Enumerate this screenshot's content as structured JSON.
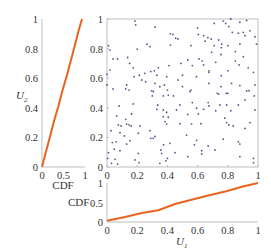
{
  "chart_data": [
    {
      "id": "scatter",
      "type": "scatter",
      "title": "",
      "xlabel": "",
      "ylabel": "",
      "xlim": [
        0,
        1
      ],
      "ylim": [
        0,
        1
      ],
      "xticks": [
        "0",
        "0.2",
        "0.4",
        "0.6",
        "0.8",
        "1"
      ],
      "yticks": [
        "0",
        "0.2",
        "0.4",
        "0.6",
        "0.8",
        "1"
      ],
      "grid": false,
      "marker_color": "#4a5a8c",
      "points": [
        [
          0.185,
          0.986
        ],
        [
          0.19,
          0.96
        ],
        [
          0.318,
          0.946
        ],
        [
          0.42,
          0.9
        ],
        [
          0.437,
          0.896
        ],
        [
          0.455,
          0.87
        ],
        [
          0.47,
          0.865
        ],
        [
          0.01,
          0.82
        ],
        [
          0.02,
          0.79
        ],
        [
          0.2,
          0.797
        ],
        [
          0.265,
          0.83
        ],
        [
          0.285,
          0.813
        ],
        [
          0.42,
          0.824
        ],
        [
          0.04,
          0.73
        ],
        [
          0.07,
          0.73
        ],
        [
          0.137,
          0.74
        ],
        [
          0.15,
          0.7
        ],
        [
          0.41,
          0.685
        ],
        [
          0.49,
          0.7
        ],
        [
          0.174,
          0.67
        ],
        [
          0.02,
          0.655
        ],
        [
          0.0,
          0.626
        ],
        [
          0.34,
          0.67
        ],
        [
          0.313,
          0.65
        ],
        [
          0.29,
          0.645
        ],
        [
          0.25,
          0.633
        ],
        [
          0.214,
          0.62
        ],
        [
          0.18,
          0.61
        ],
        [
          0.33,
          0.62
        ],
        [
          0.395,
          0.61
        ],
        [
          0.5,
          0.62
        ],
        [
          0.23,
          0.588
        ],
        [
          0.256,
          0.576
        ],
        [
          0.13,
          0.554
        ],
        [
          0.0,
          0.554
        ],
        [
          0.318,
          0.565
        ],
        [
          0.35,
          0.543
        ],
        [
          0.38,
          0.554
        ],
        [
          0.47,
          0.588
        ],
        [
          0.04,
          0.527
        ],
        [
          0.124,
          0.527
        ],
        [
          0.146,
          0.52
        ],
        [
          0.296,
          0.514
        ],
        [
          0.4,
          0.52
        ],
        [
          0.5,
          0.543
        ],
        [
          0.71,
          0.97
        ],
        [
          0.77,
          0.986
        ],
        [
          0.786,
          0.97
        ],
        [
          0.82,
          1.0
        ],
        [
          0.88,
          0.978
        ],
        [
          0.925,
          0.99
        ],
        [
          0.6,
          0.94
        ],
        [
          0.807,
          0.948
        ],
        [
          0.605,
          0.896
        ],
        [
          0.64,
          0.887
        ],
        [
          0.668,
          0.874
        ],
        [
          0.69,
          0.865
        ],
        [
          0.65,
          0.85
        ],
        [
          0.83,
          0.91
        ],
        [
          0.87,
          0.904
        ],
        [
          0.903,
          0.91
        ],
        [
          0.947,
          0.92
        ],
        [
          0.914,
          0.887
        ],
        [
          0.98,
          0.88
        ],
        [
          0.74,
          0.858
        ],
        [
          0.556,
          0.82
        ],
        [
          0.71,
          0.82
        ],
        [
          0.76,
          0.83
        ],
        [
          0.757,
          0.806
        ],
        [
          0.8,
          0.82
        ],
        [
          0.88,
          0.83
        ],
        [
          0.99,
          0.83
        ],
        [
          0.85,
          0.78
        ],
        [
          0.693,
          0.775
        ],
        [
          0.755,
          0.76
        ],
        [
          0.903,
          0.745
        ],
        [
          0.535,
          0.723
        ],
        [
          0.61,
          0.73
        ],
        [
          0.63,
          0.716
        ],
        [
          0.85,
          0.716
        ],
        [
          0.72,
          0.707
        ],
        [
          0.565,
          0.685
        ],
        [
          0.64,
          0.69
        ],
        [
          0.875,
          0.69
        ],
        [
          0.935,
          0.67
        ],
        [
          0.675,
          0.65
        ],
        [
          0.675,
          0.64
        ],
        [
          0.8,
          0.65
        ],
        [
          0.97,
          0.64
        ],
        [
          0.593,
          0.61
        ],
        [
          0.757,
          0.617
        ],
        [
          0.675,
          0.565
        ],
        [
          0.825,
          0.565
        ],
        [
          0.755,
          0.543
        ],
        [
          0.88,
          0.55
        ],
        [
          0.98,
          0.554
        ],
        [
          0.556,
          0.52
        ],
        [
          0.73,
          0.498
        ],
        [
          0.79,
          0.498
        ],
        [
          0.925,
          0.514
        ],
        [
          0.307,
          0.51
        ],
        [
          0.373,
          0.48
        ],
        [
          0.406,
          0.486
        ],
        [
          0.44,
          0.48
        ],
        [
          0.3,
          0.48
        ],
        [
          0.174,
          0.426
        ],
        [
          0.08,
          0.412
        ],
        [
          0.336,
          0.419
        ],
        [
          0.33,
          0.39
        ],
        [
          0.373,
          0.385
        ],
        [
          0.395,
          0.37
        ],
        [
          0.46,
          0.385
        ],
        [
          0.483,
          0.419
        ],
        [
          0.064,
          0.345
        ],
        [
          0.163,
          0.358
        ],
        [
          0.373,
          0.34
        ],
        [
          0.406,
          0.336
        ],
        [
          0.124,
          0.322
        ],
        [
          0.384,
          0.307
        ],
        [
          0.075,
          0.284
        ],
        [
          0.093,
          0.277
        ],
        [
          0.13,
          0.29
        ],
        [
          0.146,
          0.284
        ],
        [
          0.16,
          0.277
        ],
        [
          0.218,
          0.277
        ],
        [
          0.395,
          0.29
        ],
        [
          0.483,
          0.293
        ],
        [
          0.026,
          0.245
        ],
        [
          0.086,
          0.232
        ],
        [
          0.207,
          0.228
        ],
        [
          0.285,
          0.245
        ],
        [
          0.318,
          0.206
        ],
        [
          0.115,
          0.21
        ],
        [
          0.29,
          0.194
        ],
        [
          0.306,
          0.194
        ],
        [
          0.152,
          0.178
        ],
        [
          0.035,
          0.165
        ],
        [
          0.06,
          0.17
        ],
        [
          0.13,
          0.155
        ],
        [
          0.417,
          0.16
        ],
        [
          0.375,
          0.15
        ],
        [
          0.048,
          0.12
        ],
        [
          0.086,
          0.11
        ],
        [
          0.357,
          0.115
        ],
        [
          0.01,
          0.097
        ],
        [
          0.207,
          0.092
        ],
        [
          0.362,
          0.092
        ],
        [
          0.45,
          0.097
        ],
        [
          0.005,
          0.058
        ],
        [
          0.053,
          0.052
        ],
        [
          0.185,
          0.048
        ],
        [
          0.4,
          0.058
        ],
        [
          0.03,
          0.025
        ],
        [
          0.07,
          0.02
        ],
        [
          0.212,
          0.029
        ],
        [
          0.35,
          0.025
        ],
        [
          0.39,
          0.042
        ],
        [
          0.55,
          0.51
        ],
        [
          0.74,
          0.493
        ],
        [
          0.8,
          0.498
        ],
        [
          0.94,
          0.516
        ],
        [
          0.975,
          0.48
        ],
        [
          0.565,
          0.435
        ],
        [
          0.67,
          0.435
        ],
        [
          0.675,
          0.412
        ],
        [
          0.748,
          0.419
        ],
        [
          0.792,
          0.419
        ],
        [
          0.87,
          0.419
        ],
        [
          0.914,
          0.453
        ],
        [
          0.593,
          0.397
        ],
        [
          0.64,
          0.39
        ],
        [
          0.72,
          0.38
        ],
        [
          0.82,
          0.38
        ],
        [
          0.98,
          0.385
        ],
        [
          0.535,
          0.355
        ],
        [
          0.605,
          0.358
        ],
        [
          0.78,
          0.33
        ],
        [
          0.792,
          0.3
        ],
        [
          0.807,
          0.284
        ],
        [
          0.836,
          0.277
        ],
        [
          0.947,
          0.3
        ],
        [
          0.56,
          0.29
        ],
        [
          0.622,
          0.293
        ],
        [
          0.914,
          0.26
        ],
        [
          0.527,
          0.216
        ],
        [
          0.77,
          0.188
        ],
        [
          0.593,
          0.18
        ],
        [
          0.87,
          0.17
        ],
        [
          0.88,
          0.155
        ],
        [
          0.579,
          0.15
        ],
        [
          0.67,
          0.142
        ],
        [
          0.627,
          0.11
        ],
        [
          0.715,
          0.115
        ],
        [
          0.627,
          0.088
        ],
        [
          0.535,
          0.07
        ],
        [
          0.88,
          0.07
        ],
        [
          0.97,
          0.058
        ],
        [
          0.97,
          0.029
        ]
      ]
    },
    {
      "id": "left-marginal",
      "type": "line",
      "title": "",
      "xlabel": "CDF",
      "ylabel": "U2",
      "xlim": [
        0,
        1
      ],
      "ylim": [
        0,
        1
      ],
      "xticks": [
        "0",
        "0.5",
        "1"
      ],
      "yticks": [
        "0",
        "0.2",
        "0.4",
        "0.6",
        "0.8",
        "1"
      ],
      "grid": false,
      "line_color": "#e8641e",
      "points": [
        [
          0,
          0
        ],
        [
          0.08,
          0.09
        ],
        [
          0.18,
          0.2
        ],
        [
          0.28,
          0.31
        ],
        [
          0.38,
          0.41
        ],
        [
          0.48,
          0.52
        ],
        [
          0.58,
          0.62
        ],
        [
          0.68,
          0.73
        ],
        [
          0.78,
          0.84
        ],
        [
          0.86,
          0.93
        ],
        [
          0.93,
          1.0
        ]
      ]
    },
    {
      "id": "bottom-marginal",
      "type": "line",
      "title": "",
      "xlabel": "U1",
      "ylabel": "CDF",
      "xlim": [
        0,
        1
      ],
      "ylim": [
        0,
        1
      ],
      "xticks": [
        "0",
        "0.2",
        "0.4",
        "0.6",
        "0.8",
        "1"
      ],
      "yticks": [
        "0",
        "0.5",
        "1"
      ],
      "grid": false,
      "line_color": "#e8641e",
      "points": [
        [
          0,
          0.03
        ],
        [
          0.12,
          0.13
        ],
        [
          0.23,
          0.23
        ],
        [
          0.34,
          0.3
        ],
        [
          0.45,
          0.46
        ],
        [
          0.56,
          0.57
        ],
        [
          0.67,
          0.68
        ],
        [
          0.79,
          0.79
        ],
        [
          0.9,
          0.91
        ],
        [
          1.0,
          1.0
        ]
      ]
    }
  ],
  "labels": {
    "left_ylabel_main": "U",
    "left_ylabel_sub": "2",
    "left_xlabel": "CDF",
    "bottom_ylabel": "CDF",
    "bottom_xlabel_main": "U",
    "bottom_xlabel_sub": "1"
  }
}
